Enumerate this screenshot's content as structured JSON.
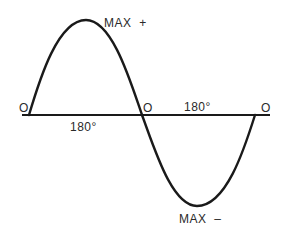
{
  "diagram": {
    "type": "sine-wave",
    "colors": {
      "line": "#1a1a1a",
      "text": "#2a2a2a",
      "background": "#ffffff"
    },
    "labels": {
      "zero_left": "O",
      "zero_middle": "O",
      "zero_right": "O",
      "half_cycle_first": "180°",
      "half_cycle_second": "180°",
      "max_positive": "MAX  +",
      "max_negative": "MAX  –"
    }
  }
}
